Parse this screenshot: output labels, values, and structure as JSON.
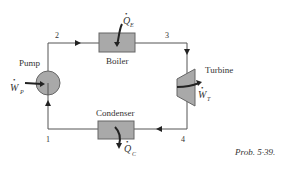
{
  "diagram": {
    "type": "Rankine cycle schematic",
    "components": {
      "pump": "Pump",
      "boiler": "Boiler",
      "turbine": "Turbine",
      "condenser": "Condenser"
    },
    "states": [
      "1",
      "2",
      "3",
      "4"
    ],
    "energy_labels": {
      "pump_work": {
        "symbol": "W",
        "subscript": "P"
      },
      "boiler_heat": {
        "symbol": "Q",
        "subscript": "E"
      },
      "turbine_work": {
        "symbol": "W",
        "subscript": "T"
      },
      "condenser_heat": {
        "symbol": "Q",
        "subscript": "C"
      }
    },
    "caption": "Prob. 5·39.",
    "colors": {
      "line": "#555555",
      "component_fill": "#a9a9a9",
      "component_stroke": "#666666",
      "text": "#333333"
    }
  }
}
